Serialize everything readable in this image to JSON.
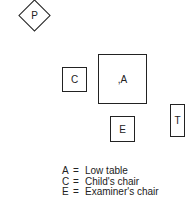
{
  "diagram": {
    "shapes": [
      {
        "id": "P",
        "label": "P",
        "shape": "diamond"
      },
      {
        "id": "C",
        "label": "C",
        "shape": "square"
      },
      {
        "id": "A",
        "label": ",A",
        "shape": "square"
      },
      {
        "id": "E",
        "label": "E",
        "shape": "square"
      },
      {
        "id": "T",
        "label": "T",
        "shape": "rectangle"
      }
    ],
    "legend": [
      {
        "key": "A",
        "eq": "=",
        "desc": "Low table"
      },
      {
        "key": "C",
        "eq": "=",
        "desc": "Child's chair"
      },
      {
        "key": "E",
        "eq": "=",
        "desc": "Examiner's chair"
      }
    ]
  }
}
